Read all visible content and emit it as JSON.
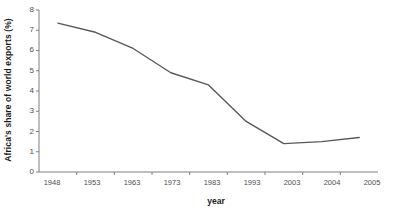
{
  "chart_data": {
    "type": "line",
    "title": "",
    "subtitle": "",
    "xlabel": "year",
    "ylabel": "Africa's share of world exports (%)",
    "categories": [
      "1948",
      "1953",
      "1963",
      "1973",
      "1983",
      "1993",
      "2003",
      "2004",
      "2005"
    ],
    "values": [
      7.35,
      6.9,
      6.1,
      4.9,
      4.3,
      2.5,
      1.4,
      1.5,
      1.7
    ],
    "series": [
      {
        "name": "Africa's share of world exports",
        "values": [
          7.35,
          6.9,
          6.1,
          4.9,
          4.3,
          2.5,
          1.4,
          1.5,
          1.7
        ]
      }
    ],
    "ylim": [
      0,
      8
    ],
    "yticks": [
      0,
      1,
      2,
      3,
      4,
      5,
      6,
      7,
      8
    ],
    "ytick_labels": [
      "0",
      "1",
      "2",
      "3",
      "4",
      "5",
      "6",
      "7",
      "8"
    ],
    "grid": false,
    "legend": false,
    "legend_position": "none",
    "line_color": "#595959",
    "axis_color": "#7f7f7f",
    "text_color": "#4d4d4d",
    "background": "#ffffff"
  },
  "axes": {
    "y_title": "Africa's share of world exports (%)",
    "x_title": "year"
  }
}
